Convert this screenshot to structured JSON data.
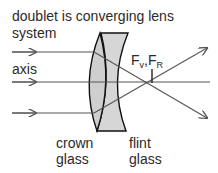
{
  "title_line1": "doublet is converging lens",
  "title_line2": "system",
  "axis_label": "axis",
  "focus_label": {
    "F": "F",
    "v": "v",
    "sep": ",",
    "F2": "F",
    "R": "R"
  },
  "crown_label": {
    "line1": "crown",
    "line2": "glass"
  },
  "flint_label": {
    "line1": "flint",
    "line2": "glass"
  },
  "colors": {
    "line": "#555555",
    "lens_fill": "#d4d4d4",
    "lens_stroke": "#111111",
    "text": "#2a2a2a"
  }
}
